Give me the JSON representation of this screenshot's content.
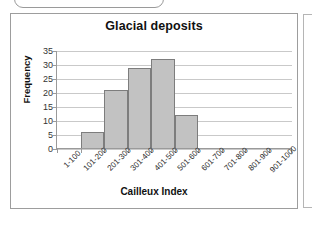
{
  "chart_data": {
    "type": "bar",
    "title": "Glacial deposits",
    "xlabel": "Cailleux Index",
    "ylabel": "Frequency",
    "categories": [
      "1-100",
      "101-200",
      "201-300",
      "301-400",
      "401-500",
      "501-600",
      "601-700",
      "701-800",
      "801-900",
      "901-1000"
    ],
    "values": [
      0,
      6,
      21,
      29,
      32,
      12,
      0,
      0,
      0,
      0
    ],
    "ylim": [
      0,
      35
    ],
    "yticks": [
      0,
      5,
      10,
      15,
      20,
      25,
      30,
      35
    ],
    "grid": true,
    "legend": false,
    "bar_fill_color": "#c2c2c2",
    "bar_edge_color": "#7d7d7d",
    "gridline_color": "#c9c9c9",
    "axis_color": "#9a9a9a"
  }
}
